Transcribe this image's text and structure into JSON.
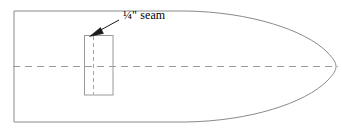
{
  "figure": {
    "type": "sewing-pattern-diagram",
    "background_color": "#ffffff",
    "width": 342,
    "height": 131,
    "annotation": {
      "label": "¼\" seam",
      "label_color": "#000000",
      "arrow_color": "#1a1a1a",
      "arrow_tip_x": 90,
      "arrow_tip_y": 36,
      "arrow_tail_x": 119,
      "arrow_tail_y": 20
    },
    "outline": {
      "name": "pattern-piece-outline",
      "stroke_color": "#8a8a8a",
      "fill_color": "#ffffff",
      "left_x": 12,
      "top_y": 10,
      "bottom_y": 123,
      "nose_tip_x": 336,
      "nose_start_x": 186
    },
    "centerline": {
      "name": "fold-centerline",
      "stroke_color": "#9b9b9b",
      "style": "dashed",
      "y": 66,
      "x_start": 14,
      "x_end": 338
    },
    "seam_box": {
      "name": "seam-allowance-rectangle",
      "stroke_color": "#9a9a9a",
      "x": 84,
      "y": 35,
      "width": 29,
      "height": 60,
      "inner_dash_x": 93,
      "inner_dash_color": "#a6a6a6"
    }
  }
}
